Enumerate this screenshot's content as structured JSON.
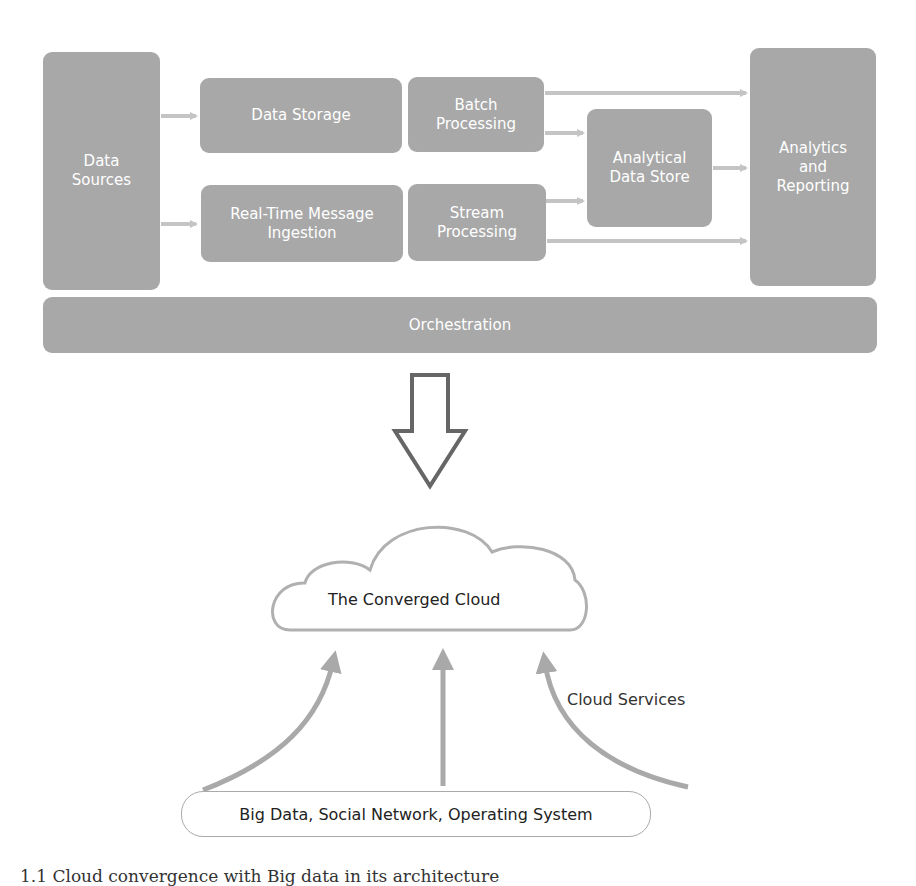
{
  "top_diagram": {
    "boxes": {
      "data_sources": "Data\nSources",
      "data_storage": "Data Storage",
      "realtime_ingestion": "Real-Time Message\nIngestion",
      "batch_processing": "Batch\nProcessing",
      "stream_processing": "Stream\nProcessing",
      "analytical_store": "Analytical\nData Store",
      "analytics_reporting": "Analytics\nand\nReporting",
      "orchestration": "Orchestration"
    },
    "colors": {
      "box_fill": "#a8a8a8",
      "arrow": "#c4c4c4",
      "text": "#ffffff"
    }
  },
  "transition_arrow": {
    "icon": "down-arrow-outline-icon"
  },
  "bottom_diagram": {
    "cloud_label": "The Converged Cloud",
    "services_label": "Cloud Services",
    "base_label": "Big Data, Social Network, Operating System"
  },
  "caption": "1.1  Cloud convergence with Big data in its architecture"
}
